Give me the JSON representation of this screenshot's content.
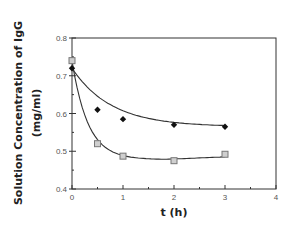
{
  "chart_data": {
    "type": "scatter",
    "title": "",
    "xlabel": "t (h)",
    "ylabel_line1": "Solution Concentration of IgG",
    "ylabel_line2": "(mg/ml)",
    "xlim": [
      0,
      4
    ],
    "ylim": [
      0.4,
      0.8
    ],
    "x_ticks": [
      "0",
      "1",
      "2",
      "3",
      "4"
    ],
    "y_ticks": [
      "0.4",
      "0.5",
      "0.6",
      "0.7",
      "0.8"
    ],
    "grid": false,
    "legend": null,
    "series": [
      {
        "name": "filled-diamond",
        "marker": "diamond",
        "color": "#111111",
        "x": [
          0,
          0.5,
          1,
          2,
          3
        ],
        "y": [
          0.72,
          0.61,
          0.585,
          0.57,
          0.565
        ],
        "fit_curve": true
      },
      {
        "name": "open-square",
        "marker": "square",
        "color": "#777777",
        "x": [
          0,
          0.5,
          1,
          2,
          3
        ],
        "y": [
          0.74,
          0.52,
          0.487,
          0.475,
          0.492
        ],
        "fit_curve": true
      }
    ]
  }
}
